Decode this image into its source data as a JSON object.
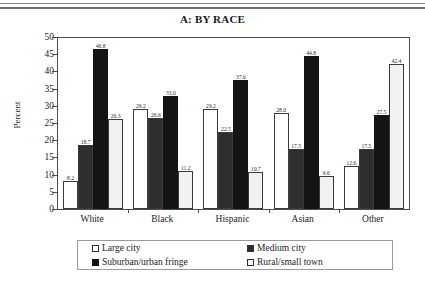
{
  "chart_data": {
    "type": "bar",
    "title": "A: BY RACE",
    "xlabel": "",
    "ylabel": "Percent",
    "ylim": [
      0,
      50
    ],
    "ytick_step": 5,
    "yticks": [
      50,
      45,
      40,
      35,
      30,
      25,
      20,
      15,
      10,
      5,
      0
    ],
    "grid": false,
    "legend_position": "bottom",
    "categories": [
      "White",
      "Black",
      "Hispanic",
      "Asian",
      "Other"
    ],
    "series": [
      {
        "name": "Large city",
        "pattern": "white",
        "values": [
          8.2,
          29.2,
          29.2,
          28.0,
          12.6
        ]
      },
      {
        "name": "Medium city",
        "pattern": "crosshatch",
        "values": [
          18.7,
          26.6,
          22.5,
          17.5,
          17.5
        ]
      },
      {
        "name": "Suburban/urban fringe",
        "pattern": "black",
        "values": [
          46.8,
          33.0,
          37.6,
          44.8,
          27.5
        ]
      },
      {
        "name": "Rural/small town",
        "pattern": "light-gray",
        "values": [
          26.3,
          11.2,
          10.7,
          9.6,
          42.4
        ]
      }
    ]
  },
  "legend": {
    "items": [
      {
        "label": "Large city",
        "swatch": "large-city"
      },
      {
        "label": "Medium city",
        "swatch": "medium-city"
      },
      {
        "label": "Suburban/urban fringe",
        "swatch": "suburban"
      },
      {
        "label": "Rural/small town",
        "swatch": "rural"
      }
    ]
  },
  "colors": {
    "bar_large_city": "#ffffff",
    "bar_medium_city": "#b9b9b9",
    "bar_suburban": "#141414",
    "bar_rural": "#f1f1f1",
    "axis": "#4a4a4a",
    "text": "#1a1a1a"
  }
}
